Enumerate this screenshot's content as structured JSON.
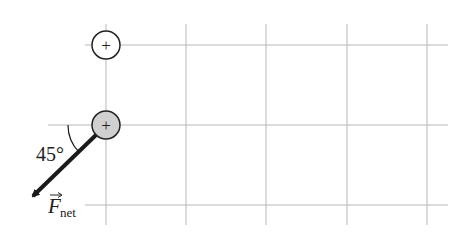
{
  "diagram": {
    "grid": {
      "vertical_x": [
        106,
        186,
        266,
        347,
        427
      ],
      "vertical_y_range": [
        24,
        225
      ],
      "horizontal_y": [
        45,
        125,
        205
      ],
      "color": "#b8b8b8"
    },
    "charges": [
      {
        "id": "top",
        "sign": "+",
        "cx": 106,
        "cy": 45,
        "fill": "#ffffff"
      },
      {
        "id": "bottom",
        "sign": "+",
        "cx": 106,
        "cy": 125,
        "fill": "#d0d0d0"
      }
    ],
    "force_vector": {
      "label_main": "F",
      "label_sub": "net",
      "angle_label": "45°",
      "color": "#1a1a1a"
    }
  }
}
